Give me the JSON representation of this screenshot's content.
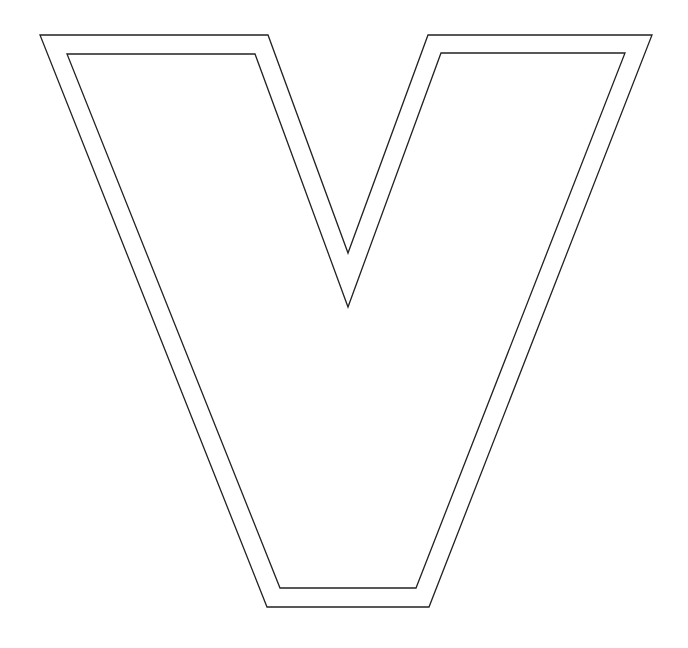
{
  "figure": {
    "letter": "V",
    "stroke_color": "#222222",
    "fill_color": "#ffffff",
    "background_color": "#ffffff",
    "stroke_width": 1.3,
    "outer_outline": {
      "points": [
        [
          40,
          35
        ],
        [
          268,
          35
        ],
        [
          348,
          253
        ],
        [
          428,
          35
        ],
        [
          652,
          35
        ],
        [
          429,
          607
        ],
        [
          267,
          607
        ]
      ]
    },
    "inner_outline": {
      "points": [
        [
          67,
          54
        ],
        [
          255,
          54
        ],
        [
          348,
          307
        ],
        [
          441,
          53
        ],
        [
          625,
          53
        ],
        [
          416,
          588
        ],
        [
          280,
          588
        ]
      ]
    }
  }
}
